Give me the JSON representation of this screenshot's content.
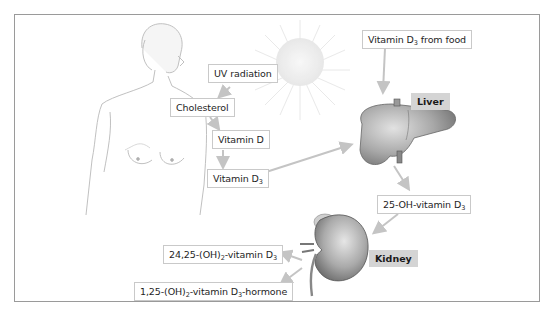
{
  "diagram": {
    "nodes": {
      "uv": {
        "text": "UV radiation"
      },
      "cholesterol": {
        "text": "Cholesterol"
      },
      "vitamin_d": {
        "text": "Vitamin D"
      },
      "vitamin_d3": {
        "prefix": "Vitamin D",
        "sub": "3",
        "suffix": ""
      },
      "food": {
        "prefix": "Vitamin D",
        "sub": "3",
        "suffix": " from food"
      },
      "oh25": {
        "prefix": "25-OH-vitamin D",
        "sub": "3",
        "suffix": ""
      },
      "oh2425": {
        "prefix": "24,25-(OH)",
        "sub": "2",
        "mid": "-vitamin D",
        "sub2": "3",
        "suffix": ""
      },
      "oh125": {
        "prefix": "1,25-(OH)",
        "sub": "2",
        "mid": "-vitamin D",
        "sub2": "3",
        "suffix": "-hormone"
      }
    },
    "organs": {
      "liver": {
        "text": "Liver"
      },
      "kidney": {
        "text": "Kidney"
      }
    },
    "edges": [
      {
        "from": "uv",
        "to": "cholesterol"
      },
      {
        "from": "cholesterol",
        "to": "vitamin_d"
      },
      {
        "from": "vitamin_d",
        "to": "vitamin_d3"
      },
      {
        "from": "vitamin_d3",
        "to": "liver"
      },
      {
        "from": "food",
        "to": "liver"
      },
      {
        "from": "liver",
        "to": "oh25"
      },
      {
        "from": "oh25",
        "to": "kidney"
      },
      {
        "from": "kidney",
        "to": "oh2425"
      },
      {
        "from": "kidney",
        "to": "oh125"
      }
    ],
    "illustrations": [
      "woman-torso",
      "sun",
      "liver",
      "kidney"
    ],
    "colors": {
      "arrow": "#c4c4c4",
      "label_border": "#c9c9c9",
      "organ_label_bg": "#d4d4d4",
      "frame": "#9a9a9a"
    }
  }
}
